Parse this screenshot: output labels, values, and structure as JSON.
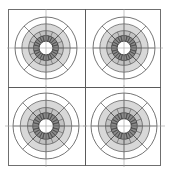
{
  "figure": {
    "title": "",
    "width": 170,
    "height": 175,
    "background": "#ffffff",
    "frame": {
      "x": 8,
      "y": 9,
      "width": 153,
      "height": 157,
      "border_color": "#6f6f6f"
    },
    "grid": {
      "rows": 2,
      "cols": 2,
      "divider_color": "#5a5a5a",
      "axis_color": "#9a9a9a",
      "vertical_divider_x": 85,
      "horizontal_divider_y": 87
    },
    "colors": {
      "outer_ring_fill": "#d8d8d8",
      "mid_ring_fill": "#c2c2c2",
      "inner_ring_fill": "#8c8c8c",
      "hub_fill": "#ffffff",
      "stroke": "#3a3a3a",
      "light_stroke": "#9a9a9a"
    }
  },
  "chart_data": {
    "type": "pie",
    "subtype": "polar-rose-grid",
    "title": "",
    "xlabel": "",
    "ylabel": "",
    "n_panels": 4,
    "sectors": 24,
    "sector_width_deg": 15,
    "rings": [
      {
        "name": "outer",
        "r_outer": 1.0,
        "r_inner": 0.78,
        "fill": "#ffffff"
      },
      {
        "name": "band-1",
        "r_outer": 0.78,
        "r_inner": 0.56,
        "fill": "#d8d8d8"
      },
      {
        "name": "band-2",
        "r_outer": 0.56,
        "r_inner": 0.4,
        "fill": "#c2c2c2"
      },
      {
        "name": "band-3",
        "r_outer": 0.4,
        "r_inner": 0.22,
        "fill": "#8c8c8c"
      },
      {
        "name": "hub",
        "r_outer": 0.22,
        "r_inner": 0.0,
        "fill": "#ffffff"
      }
    ],
    "axis_ticks_deg": [
      0,
      45,
      90,
      135,
      180,
      225,
      270,
      315
    ],
    "grid": true,
    "legend": "none",
    "panels": [
      {
        "id": "panel-top-left",
        "label": "",
        "center_x": 46,
        "center_y": 48,
        "radius": 31,
        "values": [
          0.62,
          0.7,
          0.58,
          0.66,
          0.74,
          0.6,
          0.55,
          0.68,
          0.72,
          0.64,
          0.59,
          0.67,
          0.71,
          0.63,
          0.57,
          0.69,
          0.73,
          0.61,
          0.56,
          0.65,
          0.7,
          0.62,
          0.58,
          0.66
        ]
      },
      {
        "id": "panel-top-right",
        "label": "",
        "center_x": 124,
        "center_y": 48,
        "radius": 31,
        "values": [
          0.66,
          0.72,
          0.6,
          0.68,
          0.75,
          0.63,
          0.57,
          0.7,
          0.74,
          0.65,
          0.61,
          0.69,
          0.72,
          0.64,
          0.59,
          0.71,
          0.75,
          0.62,
          0.58,
          0.67,
          0.71,
          0.63,
          0.6,
          0.68
        ]
      },
      {
        "id": "panel-bottom-left",
        "label": "",
        "center_x": 46,
        "center_y": 126,
        "radius": 33,
        "values": [
          0.68,
          0.74,
          0.62,
          0.7,
          0.77,
          0.65,
          0.59,
          0.72,
          0.76,
          0.67,
          0.63,
          0.71,
          0.74,
          0.66,
          0.61,
          0.73,
          0.77,
          0.64,
          0.6,
          0.69,
          0.73,
          0.65,
          0.62,
          0.7
        ]
      },
      {
        "id": "panel-bottom-right",
        "label": "",
        "center_x": 124,
        "center_y": 126,
        "radius": 33,
        "values": [
          0.67,
          0.73,
          0.61,
          0.69,
          0.76,
          0.64,
          0.58,
          0.71,
          0.75,
          0.66,
          0.62,
          0.7,
          0.73,
          0.65,
          0.6,
          0.72,
          0.76,
          0.63,
          0.59,
          0.68,
          0.72,
          0.64,
          0.61,
          0.69
        ]
      }
    ]
  }
}
